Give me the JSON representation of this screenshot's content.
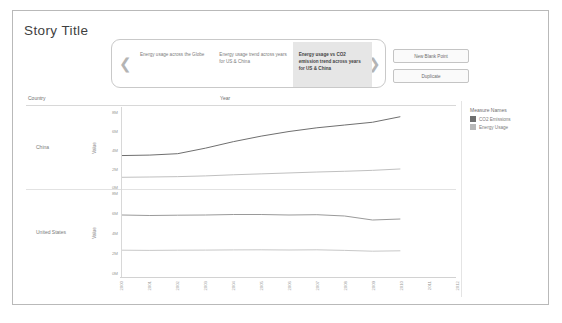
{
  "story": {
    "title": "Story Title",
    "nav": {
      "prev_icon": "chevron-left-icon",
      "next_icon": "chevron-right-icon"
    },
    "points": [
      {
        "label": "Energy usage across the Globe",
        "active": false
      },
      {
        "label": "Energy usage trend across years for US & China",
        "active": false
      },
      {
        "label": "Energy usage vs CO2 emission trend across years for US & China",
        "active": true
      }
    ],
    "buttons": {
      "new_blank_point": "New Blank Point",
      "duplicate": "Duplicate"
    }
  },
  "viz": {
    "row_header": "Country",
    "column_header": "Year",
    "axis_title": "Value",
    "null_badge": "1 null",
    "legend": {
      "title": "Measure Names",
      "items": [
        {
          "label": "CO2 Emissions",
          "color": "#6f6f6f"
        },
        {
          "label": "Energy Usage",
          "color": "#b8b8b8"
        }
      ]
    }
  },
  "chart_data": {
    "type": "line",
    "title": "Energy usage vs CO2 emission trend across years for US & China",
    "xlabel": "Year",
    "ylabel": "Value",
    "ylim": [
      0,
      8000000
    ],
    "ytick_labels": [
      "8M",
      "6M",
      "4M",
      "2M",
      "0M"
    ],
    "ytick_values": [
      8000000,
      6000000,
      4000000,
      2000000,
      0
    ],
    "grid": false,
    "legend_position": "right",
    "x": [
      2000,
      2001,
      2002,
      2003,
      2004,
      2005,
      2006,
      2007,
      2008,
      2009,
      2010,
      2011,
      2012
    ],
    "xtick_labels": [
      "2000",
      "2001",
      "2002",
      "2003",
      "2004",
      "2005",
      "2006",
      "2007",
      "2008",
      "2009",
      "2010",
      "2011",
      "2012"
    ],
    "panels": [
      {
        "name": "China",
        "series": [
          {
            "name": "CO2 Emissions",
            "color": "#6f6f6f",
            "values": [
              3400000,
              3450000,
              3600000,
              4200000,
              4900000,
              5500000,
              6000000,
              6400000,
              6700000,
              7000000,
              7600000,
              null,
              null
            ]
          },
          {
            "name": "Energy Usage",
            "color": "#c0c0c0",
            "values": [
              1050000,
              1080000,
              1120000,
              1200000,
              1320000,
              1420000,
              1520000,
              1620000,
              1700000,
              1800000,
              1950000,
              null,
              null
            ]
          }
        ]
      },
      {
        "name": "United States",
        "series": [
          {
            "name": "CO2 Emissions",
            "color": "#9a9a9a",
            "values": [
              5800000,
              5750000,
              5780000,
              5800000,
              5850000,
              5850000,
              5800000,
              5830000,
              5700000,
              5300000,
              5400000,
              null,
              null
            ]
          },
          {
            "name": "Energy Usage",
            "color": "#c8c8c8",
            "values": [
              2280000,
              2260000,
              2280000,
              2290000,
              2310000,
              2320000,
              2300000,
              2320000,
              2260000,
              2180000,
              2220000,
              null,
              null
            ]
          }
        ]
      }
    ]
  }
}
